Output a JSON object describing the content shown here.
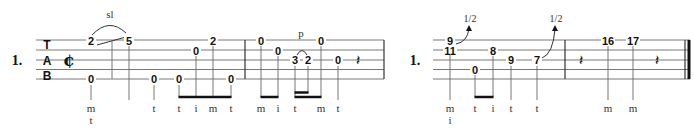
{
  "systems": [
    {
      "id": "left",
      "measure_label": "1.",
      "clef": [
        "T",
        "A",
        "B"
      ],
      "time_signature": "¢",
      "techniques": [
        {
          "type": "slide",
          "label": "sl"
        },
        {
          "type": "pull-off",
          "label": "p"
        }
      ],
      "notes": [
        {
          "fret": "2",
          "string": 1,
          "finger": "",
          "technique": "slide-start"
        },
        {
          "fret": "5",
          "string": 1,
          "finger": "",
          "technique": "slide-end"
        },
        {
          "fret": "0",
          "string": 5,
          "finger": "m\nt"
        },
        {
          "fret": "0",
          "string": 5,
          "finger": "t"
        },
        {
          "fret": "0",
          "string": 5,
          "finger": "t"
        },
        {
          "fret": "0",
          "string": 2,
          "finger": "i"
        },
        {
          "fret": "2",
          "string": 1,
          "finger": "m"
        },
        {
          "fret": "0",
          "string": 5,
          "finger": "t"
        },
        {
          "fret": "0",
          "string": 1,
          "finger": "m"
        },
        {
          "fret": "0",
          "string": 2,
          "finger": "i"
        },
        {
          "fret": "3",
          "string": 3,
          "finger": "t"
        },
        {
          "fret": "2",
          "string": 3,
          "finger": ""
        },
        {
          "fret": "0",
          "string": 1,
          "finger": "m"
        },
        {
          "fret": "0",
          "string": 3,
          "finger": "t"
        }
      ],
      "fingerings": [
        "m",
        "t",
        "t",
        "t",
        "i",
        "m",
        "t",
        "m",
        "i",
        "t",
        "m",
        "t"
      ],
      "rests": [
        "quarter"
      ]
    },
    {
      "id": "right",
      "measure_label": "1.",
      "bends": [
        "1/2",
        "1/2"
      ],
      "notes": [
        {
          "fret": "9",
          "string": 1
        },
        {
          "fret": "11",
          "string": 2
        },
        {
          "fret": "0",
          "string": 4
        },
        {
          "fret": "8",
          "string": 2
        },
        {
          "fret": "9",
          "string": 3
        },
        {
          "fret": "7",
          "string": 3
        },
        {
          "fret": "16",
          "string": 1
        },
        {
          "fret": "17",
          "string": 1
        }
      ],
      "fingerings": [
        "m",
        "i",
        "t",
        "i",
        "t",
        "t",
        "m",
        "m"
      ],
      "rests": [
        "quarter",
        "quarter"
      ]
    }
  ]
}
